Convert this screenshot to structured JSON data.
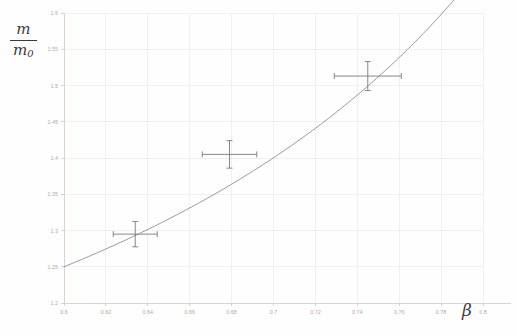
{
  "chart_data": {
    "type": "line",
    "title": "",
    "subtitle": "",
    "xlabel": "β",
    "ylabel_numerator": "m",
    "ylabel_denominator": "m",
    "ylabel_denominator_sub": "0",
    "ylabel_text": "m/m0",
    "xlim": [
      0.6,
      0.8
    ],
    "ylim": [
      1.2,
      1.6
    ],
    "xticks": [
      0.6,
      0.62,
      0.64,
      0.66,
      0.68,
      0.7,
      0.72,
      0.74,
      0.76,
      0.78,
      0.8
    ],
    "xticklabels": [
      "0.6",
      "0.62",
      "0.64",
      "0.66",
      "0.68",
      "0.7",
      "0.72",
      "0.74",
      "0.76",
      "0.78",
      "0.8"
    ],
    "yticks": [
      1.2,
      1.25,
      1.3,
      1.35,
      1.4,
      1.45,
      1.5,
      1.55,
      1.6
    ],
    "yticklabels": [
      "1.2",
      "1.25",
      "1.3",
      "1.35",
      "1.4",
      "1.45",
      "1.5",
      "1.55",
      "1.6"
    ],
    "grid": true,
    "grid_color": "#ece9e6",
    "axis_color": "#d8d4d0",
    "tick_label_color": "#b0aaa4",
    "legend": null,
    "legend_position": "none",
    "series": [
      {
        "name": "Lorentz factor curve",
        "type": "line",
        "color": "#8a8a8a",
        "linewidth": 0.9,
        "formula": "1/sqrt(1-beta^2)",
        "x": [
          0.6,
          0.61,
          0.62,
          0.63,
          0.64,
          0.65,
          0.66,
          0.67,
          0.68,
          0.69,
          0.7,
          0.71,
          0.72,
          0.73,
          0.74,
          0.75,
          0.76,
          0.77,
          0.78,
          0.79,
          0.8
        ],
        "y": [
          1.25,
          1.2615,
          1.2739,
          1.287,
          1.3009,
          1.3159,
          1.3318,
          1.3487,
          1.3667,
          1.386,
          1.4003,
          1.4213,
          1.4416,
          1.4635,
          1.487,
          1.5119,
          1.5386,
          1.5674,
          1.5981,
          1.6313,
          1.6667
        ]
      },
      {
        "name": "Measured points",
        "type": "scatter-errorbar",
        "color": "#7a7a7a",
        "marker": "cross",
        "points": [
          {
            "x": 0.634,
            "y": 1.295,
            "xerr": 0.0105,
            "yerr": 0.0175
          },
          {
            "x": 0.679,
            "y": 1.405,
            "xerr": 0.013,
            "yerr": 0.019
          },
          {
            "x": 0.745,
            "y": 1.513,
            "xerr": 0.016,
            "yerr": 0.02
          }
        ]
      }
    ]
  },
  "figure": {
    "background": "#fefefe",
    "plot_area": {
      "left": 64,
      "top": 13,
      "right": 483,
      "bottom": 303
    }
  }
}
